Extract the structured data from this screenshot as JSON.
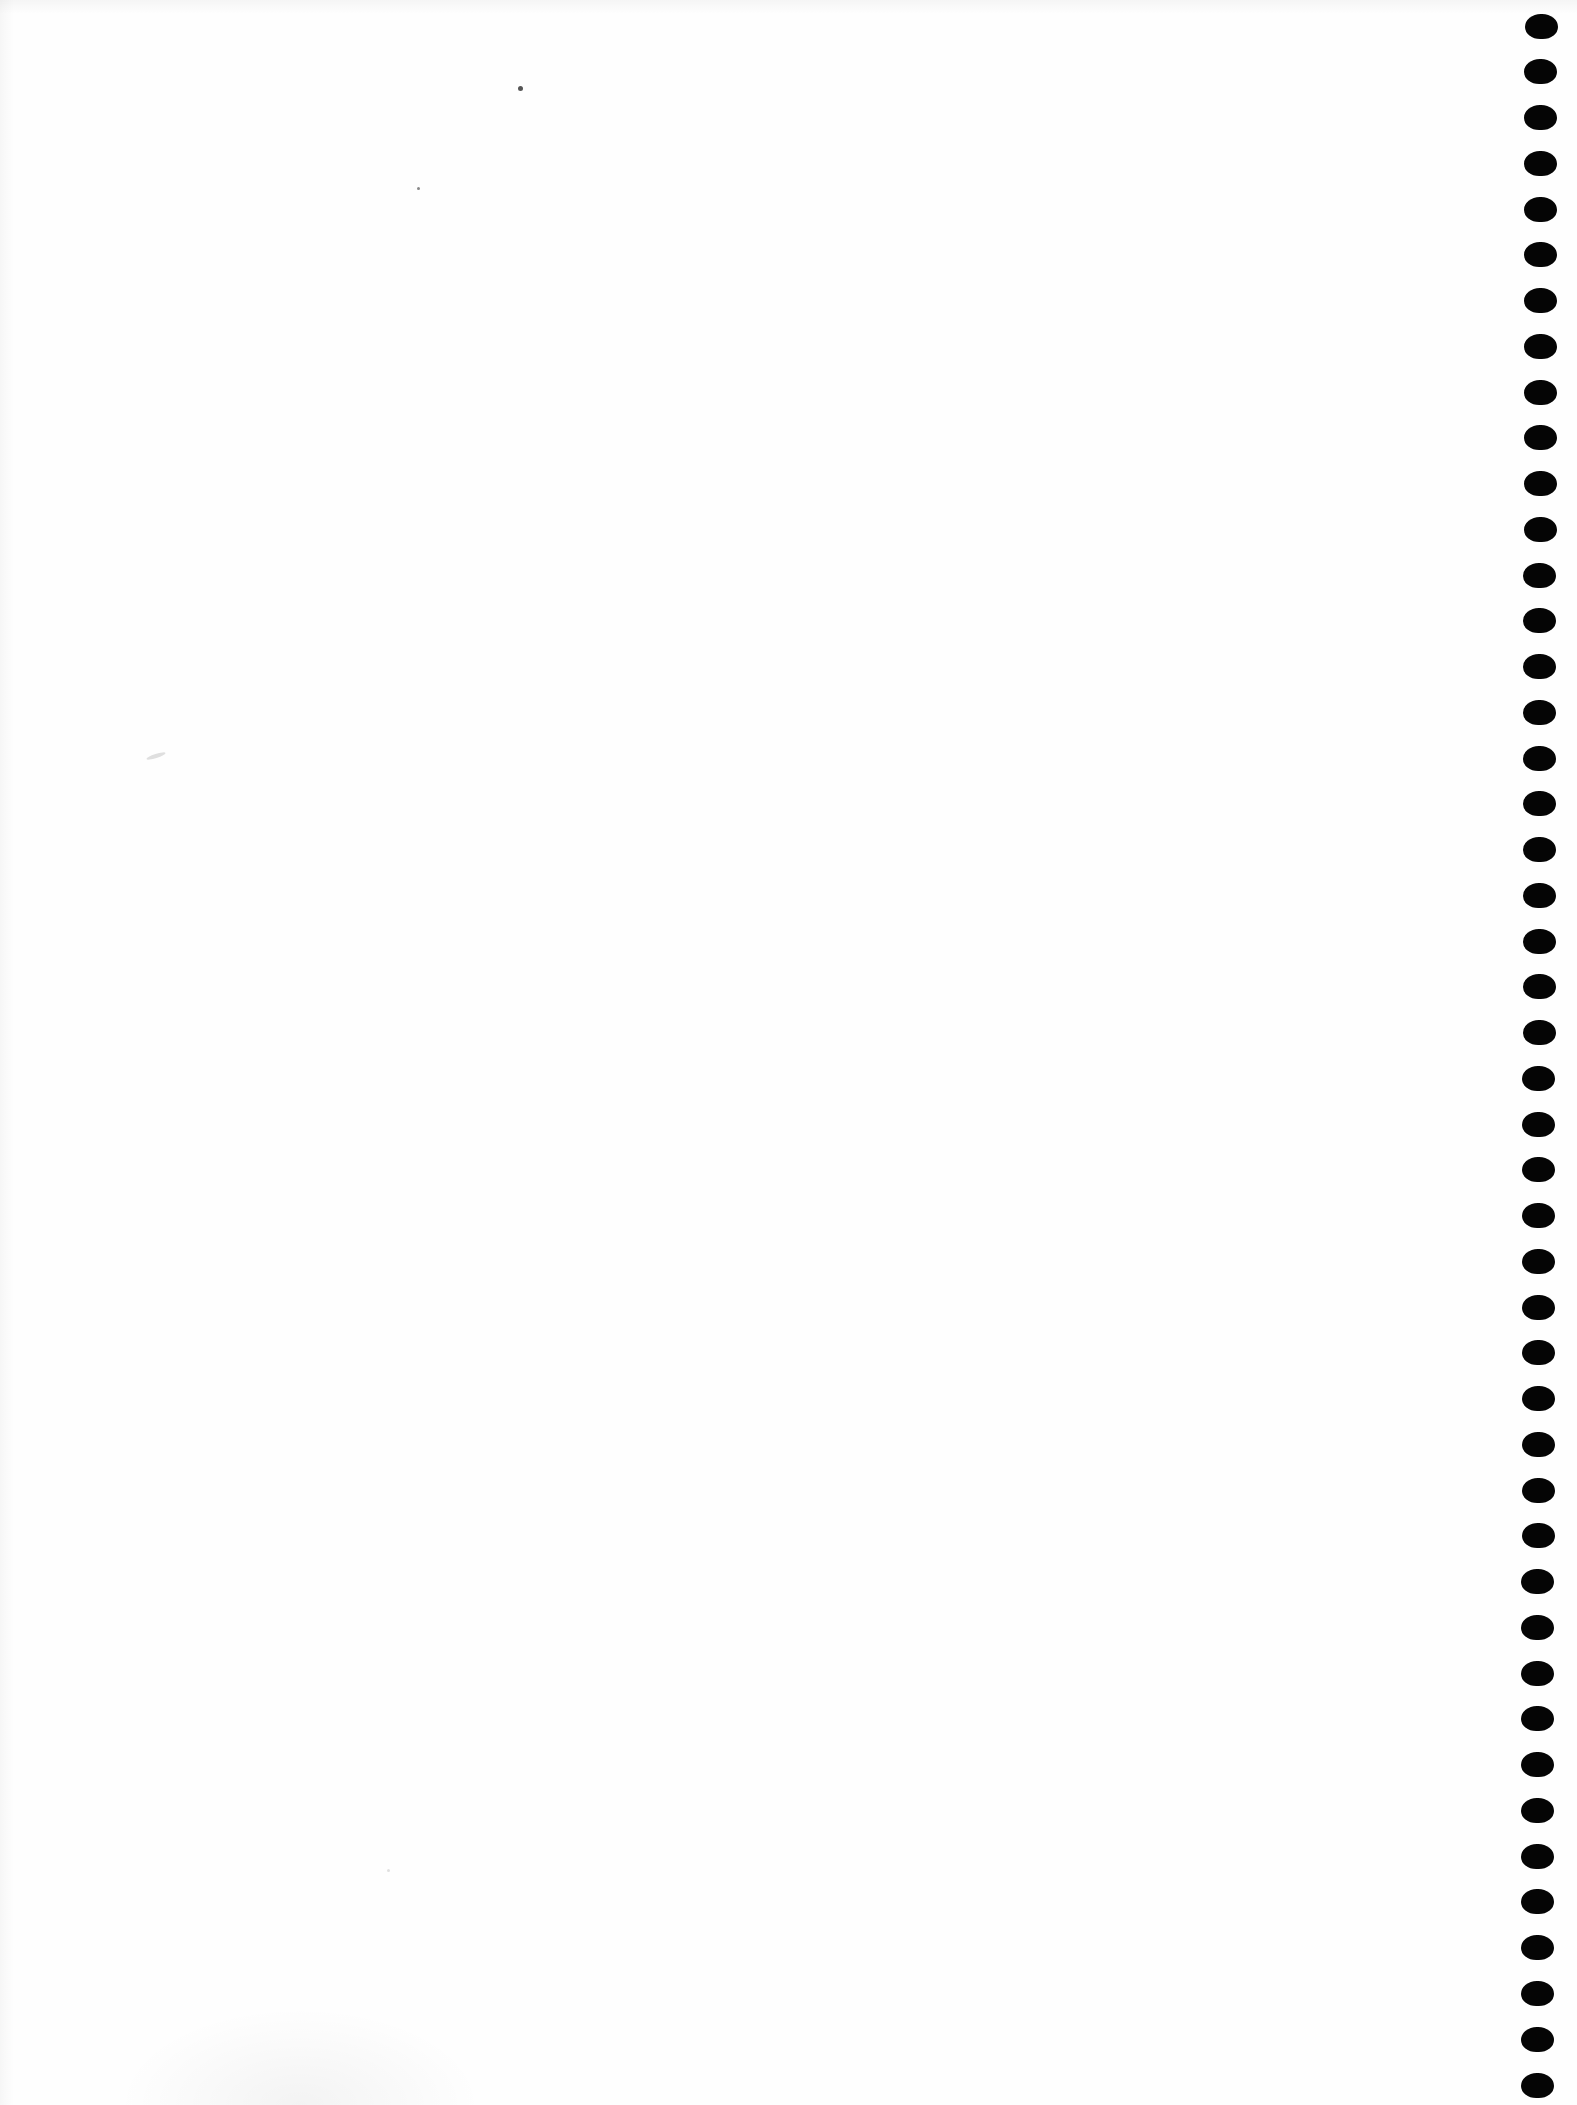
{
  "document": {
    "type": "blank notebook page",
    "content_text": ""
  },
  "binding": {
    "side": "right",
    "hole_count": 46,
    "hole_color": "#050505",
    "page_color": "#fefefe"
  },
  "marks": [
    {
      "name": "speck-top",
      "x": 520,
      "y": 88,
      "size": 4
    },
    {
      "name": "speck-small",
      "x": 418,
      "y": 188,
      "size": 3
    },
    {
      "name": "faint-mark-mid",
      "x": 158,
      "y": 756,
      "size": 6
    },
    {
      "name": "faint-mark-low",
      "x": 388,
      "y": 1870,
      "size": 3
    }
  ]
}
